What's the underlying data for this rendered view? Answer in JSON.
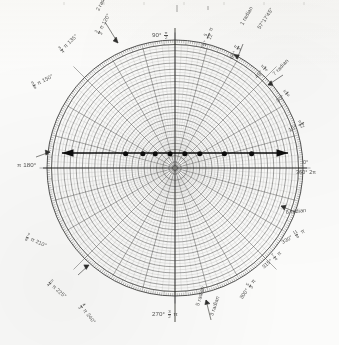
{
  "figure": {
    "kind": "polar-graph-paper",
    "paper_color": "#fbfbfa",
    "ink_color": "#3a3a38",
    "grid_color": "#6f6f6d",
    "accent_color": "#111111"
  },
  "chart_data": {
    "type": "scatter",
    "title": "",
    "subtitle": "",
    "xlabel": "",
    "ylabel": "",
    "coordinate_system": "polar",
    "grid": true,
    "legend": null,
    "axis": {
      "angular_unit_primary": "degrees",
      "angular_unit_secondary": "radians",
      "angular_range": [
        0,
        360
      ],
      "angular_tick_major": 15,
      "angular_tick_minor": 1,
      "radial_rings": 20,
      "radial_range": [
        0,
        1
      ]
    },
    "annotation_line": {
      "description": "horizontal double-headed arrow drawn across the chart just above center",
      "y_fraction_of_radius": 0.115,
      "x_start_fraction": -0.86,
      "x_end_fraction": 0.88,
      "arrow_heads": "both"
    },
    "points": [
      {
        "x": -0.4,
        "y": 0.115
      },
      {
        "x": -0.26,
        "y": 0.115
      },
      {
        "x": -0.16,
        "y": 0.115
      },
      {
        "x": -0.04,
        "y": 0.115
      },
      {
        "x": 0.08,
        "y": 0.115
      },
      {
        "x": 0.2,
        "y": 0.115
      },
      {
        "x": 0.4,
        "y": 0.115
      },
      {
        "x": 0.62,
        "y": 0.115
      }
    ]
  },
  "labels": {
    "deg_0": "0°",
    "deg_360": "360°",
    "rad_2pi": "2π",
    "deg_15": "15°",
    "rad_15_num": "π",
    "rad_15_den": "12",
    "deg_30": "30°",
    "rad_30_num": "π",
    "rad_30_den": "6",
    "deg_45": "45°",
    "rad_45_num": "π",
    "rad_45_den": "4",
    "deg_60": "60°",
    "rad_60_num": "π",
    "rad_60_den": "3",
    "deg_75": "75°",
    "rad_75_num": "5",
    "rad_75_den": "12",
    "rad_75_suffix": "π",
    "deg_90": "90°",
    "rad_90_num": "π",
    "rad_90_den": "2",
    "deg_120": "120°",
    "rad_120_num": "2",
    "rad_120_den": "3",
    "rad_120_suffix": "π",
    "deg_135": "135°",
    "rad_135_num": "3",
    "rad_135_den": "4",
    "rad_135_suffix": "π",
    "deg_150": "150°",
    "rad_150_num": "5",
    "rad_150_den": "6",
    "rad_150_suffix": "π",
    "deg_180": "180°",
    "rad_180": "π",
    "deg_210": "210°",
    "rad_210_num": "7",
    "rad_210_den": "6",
    "rad_210_suffix": "π",
    "deg_225": "225°",
    "rad_225_num": "5",
    "rad_225_den": "4",
    "rad_225_suffix": "π",
    "deg_240": "240°",
    "rad_240_num": "4",
    "rad_240_den": "3",
    "rad_240_suffix": "π",
    "deg_270": "270°",
    "rad_270_num": "3",
    "rad_270_den": "2",
    "rad_270_suffix": "π",
    "deg_300": "300°",
    "rad_300_num": "5",
    "rad_300_den": "3",
    "rad_300_suffix": "π",
    "deg_315": "315°",
    "rad_315_num": "7",
    "rad_315_den": "4",
    "rad_315_suffix": "π",
    "deg_330": "330°",
    "rad_330_num": "11",
    "rad_330_den": "6",
    "rad_330_suffix": "π",
    "radian_1": "1 radian",
    "radian_1_dms": "57°17'45\"",
    "radian_2": "2 radian",
    "radian_3": "3 radian",
    "radian_5": "5 radian",
    "radian_6": "6 radian",
    "radian_7": "7 radian"
  }
}
